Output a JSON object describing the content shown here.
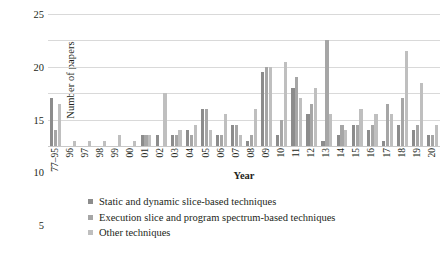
{
  "chart_data": {
    "type": "bar",
    "title": "",
    "xlabel": "Year",
    "ylabel": "Number of papers",
    "ylim": [
      0,
      25
    ],
    "yticks": [
      0,
      5,
      10,
      15,
      20,
      25
    ],
    "grid": true,
    "legend_position": "bottom-left",
    "categories": [
      "77–95",
      "96",
      "97",
      "98",
      "99",
      "00",
      "01",
      "02",
      "03",
      "04",
      "05",
      "06",
      "07",
      "08",
      "09",
      "10",
      "11",
      "12",
      "13",
      "14",
      "15",
      "16",
      "17",
      "18",
      "19",
      "20"
    ],
    "series": [
      {
        "name": "Static and dynamic slice-based techniques",
        "color": "#8c8c8c",
        "values": [
          9,
          0,
          0,
          0,
          0,
          0,
          2,
          2,
          2,
          3,
          7,
          2,
          4,
          1,
          14,
          2,
          11,
          6,
          1,
          2,
          4,
          3,
          1,
          4,
          3,
          2
        ]
      },
      {
        "name": "Execution slice and program spectrum-based techniques",
        "color": "#a6a6a6",
        "values": [
          3,
          0,
          0,
          0,
          0,
          0,
          2,
          0,
          2,
          2,
          7,
          2,
          4,
          2,
          15,
          5,
          13,
          8,
          20,
          4,
          4,
          4,
          8,
          9,
          4,
          2
        ]
      },
      {
        "name": "Other techniques",
        "color": "#bfbfbf",
        "values": [
          8,
          1,
          1,
          1,
          2,
          1,
          2,
          10,
          3,
          4,
          3,
          6,
          2,
          7,
          15,
          16,
          9,
          11,
          6,
          3,
          7,
          6,
          6,
          18,
          12,
          4
        ]
      }
    ]
  },
  "legend": {
    "items": [
      {
        "label": "Static and dynamic slice-based techniques",
        "color": "#8c8c8c"
      },
      {
        "label": "Execution slice and program spectrum-based techniques",
        "color": "#a6a6a6"
      },
      {
        "label": "Other techniques",
        "color": "#bfbfbf"
      }
    ]
  }
}
